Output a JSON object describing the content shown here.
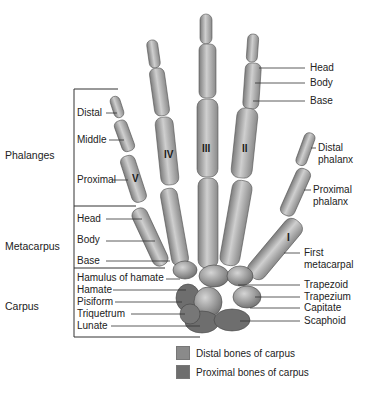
{
  "diagram": {
    "groups": [
      {
        "label": "Phalanges"
      },
      {
        "label": "Metacarpus"
      },
      {
        "label": "Carpus"
      }
    ],
    "left_labels": {
      "phalanges": [
        "Distal",
        "Middle",
        "Proximal"
      ],
      "metacarpus": [
        "Head",
        "Body",
        "Base"
      ],
      "carpus": [
        "Hamulus of hamate",
        "Hamate",
        "Pisiform",
        "Triquetrum",
        "Lunate"
      ]
    },
    "right_labels": {
      "phalanx_parts": [
        "Head",
        "Body",
        "Base"
      ],
      "thumb": [
        "Distal\nphalanx",
        "Proximal\nphalanx"
      ],
      "thumb_distal_line1": "Distal",
      "thumb_distal_line2": "phalanx",
      "thumb_proximal_line1": "Proximal",
      "thumb_proximal_line2": "phalanx",
      "first_metacarpal_line1": "First",
      "first_metacarpal_line2": "metacarpal",
      "carpus": [
        "Trapezoid",
        "Trapezium",
        "Capitate",
        "Scaphoid"
      ]
    },
    "digit_numerals": [
      "V",
      "IV",
      "III",
      "II",
      "I"
    ],
    "legend": [
      {
        "label": "Distal bones of carpus",
        "color": "#8a8a8a"
      },
      {
        "label": "Proximal bones of carpus",
        "color": "#6e6e6e"
      }
    ],
    "colors": {
      "bone": "#b8b8b8",
      "bone_shadow": "#7d7d7d",
      "bone_highlight": "#dcdcdc",
      "leader_line": "#333333"
    }
  }
}
